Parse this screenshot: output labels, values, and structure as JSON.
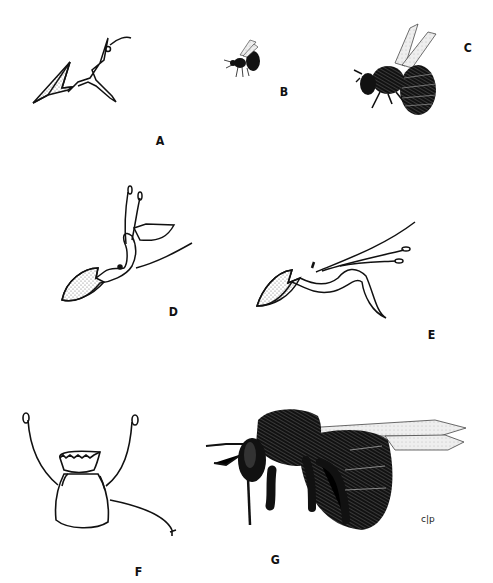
{
  "plate": {
    "figures": [
      {
        "id": "A",
        "label": "A",
        "subject": "flower, lateral view (small)"
      },
      {
        "id": "B",
        "label": "B",
        "subject": "small bee in flight"
      },
      {
        "id": "C",
        "label": "C",
        "subject": "larger bee, hairy, wings raised"
      },
      {
        "id": "D",
        "label": "D",
        "subject": "flower, lateral view with upright stamens"
      },
      {
        "id": "E",
        "label": "E",
        "subject": "flower, lateral view with extended stamens"
      },
      {
        "id": "F",
        "label": "F",
        "subject": "flower, frontal view"
      },
      {
        "id": "G",
        "label": "G",
        "subject": "large bee, lateral view with long proboscis"
      }
    ],
    "signature": "c|p",
    "colors": {
      "ink": "#111111",
      "background": "#ffffff",
      "stipple": "#555555",
      "wing": "#d8d8d8"
    }
  }
}
